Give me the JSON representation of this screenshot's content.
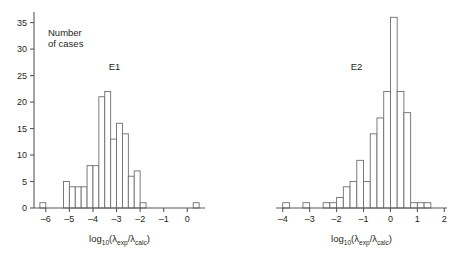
{
  "figure": {
    "background": "#ffffff",
    "ink_color": "#231f20",
    "bar_stroke": "#6d6e71",
    "axis_color": "#58595b",
    "y_axis_title_line1": "Number",
    "y_axis_title_line2": "of cases"
  },
  "chart_data": [
    {
      "type": "bar",
      "title": "E1",
      "xlabel": "log10(λexp/λcalc)",
      "ylabel": "Number of cases",
      "xlabel_parts": {
        "base": "log",
        "base_sub": "10",
        "open": "(λ",
        "num_sub": "exp",
        "slash": "/λ",
        "den_sub": "calc",
        "close": ")"
      },
      "xlim": [
        -6.5,
        0.75
      ],
      "ylim": [
        0,
        37
      ],
      "bin_width": 0.25,
      "grid": false,
      "legend": "none",
      "xticks": [
        -6,
        -5,
        -4,
        -3,
        -2,
        -1,
        0
      ],
      "xticklabels": [
        "–6",
        "–5",
        "–4",
        "–3",
        "–2",
        "–1",
        "0"
      ],
      "yticks": [
        0,
        5,
        10,
        15,
        20,
        25,
        30,
        35
      ],
      "yticklabels": [
        "0",
        "5",
        "10",
        "15",
        "20",
        "25",
        "30",
        "35"
      ],
      "bin_starts": [
        -6.5,
        -6.25,
        -6.0,
        -5.75,
        -5.5,
        -5.25,
        -5.0,
        -4.75,
        -4.5,
        -4.25,
        -4.0,
        -3.75,
        -3.5,
        -3.25,
        -3.0,
        -2.75,
        -2.5,
        -2.25,
        -2.0,
        -1.75,
        -1.5,
        -1.25,
        -1.0,
        -0.75,
        -0.5,
        -0.25,
        0.0,
        0.25,
        0.5
      ],
      "values": [
        0,
        1,
        0,
        0,
        0,
        5,
        4,
        4,
        4,
        8,
        8,
        21,
        22,
        13,
        16,
        14,
        6,
        7,
        1,
        0,
        0,
        0,
        0,
        0,
        0,
        0,
        0,
        1,
        0
      ]
    },
    {
      "type": "bar",
      "title": "E2",
      "xlabel": "log10(λexp/λcalc)",
      "ylabel": "Number of cases",
      "xlabel_parts": {
        "base": "log",
        "base_sub": "10",
        "open": "(λ",
        "num_sub": "exp",
        "slash": "/λ",
        "den_sub": "calc",
        "close": ")"
      },
      "xlim": [
        -4.25,
        2.1
      ],
      "ylim": [
        0,
        37
      ],
      "bin_width": 0.25,
      "grid": false,
      "legend": "none",
      "xticks": [
        -4,
        -3,
        -2,
        -1,
        0,
        1,
        2
      ],
      "xticklabels": [
        "–4",
        "–3",
        "–2",
        "–1",
        "0",
        "1",
        "2"
      ],
      "yticks": [],
      "yticklabels": [],
      "bin_starts": [
        -4.25,
        -4.0,
        -3.75,
        -3.5,
        -3.25,
        -3.0,
        -2.75,
        -2.5,
        -2.25,
        -2.0,
        -1.75,
        -1.5,
        -1.25,
        -1.0,
        -0.75,
        -0.5,
        -0.25,
        0.0,
        0.25,
        0.5,
        0.75,
        1.0,
        1.25,
        1.5,
        1.75
      ],
      "values": [
        0,
        1,
        0,
        0,
        1,
        0,
        0,
        1,
        1,
        2,
        4,
        5,
        9,
        5,
        14,
        17,
        22,
        36,
        22,
        18,
        1,
        1,
        1,
        0,
        0
      ]
    }
  ]
}
